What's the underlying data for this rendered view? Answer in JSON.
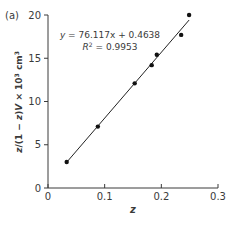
{
  "panel_label": "(a)",
  "chart_data": {
    "type": "scatter",
    "title": "",
    "xlabel": "z",
    "ylabel": "z/(1 − z)V × 10³ cm³",
    "xlim": [
      0,
      0.3
    ],
    "ylim": [
      0,
      20
    ],
    "xticks": [
      0,
      0.1,
      0.2,
      0.3
    ],
    "xtick_labels": [
      "0",
      "0.1",
      "0.2",
      "0.3"
    ],
    "yticks": [
      0,
      5,
      10,
      15,
      20
    ],
    "ytick_labels": [
      "0",
      "5",
      "10",
      "15",
      "20"
    ],
    "grid": false,
    "legend": null,
    "series": [
      {
        "name": "data",
        "x": [
          0.033,
          0.088,
          0.153,
          0.183,
          0.192,
          0.235,
          0.249
        ],
        "y": [
          3.0,
          7.1,
          12.1,
          14.2,
          15.4,
          17.7,
          20.0
        ]
      }
    ],
    "fit_line": {
      "slope": 76.117,
      "intercept": 0.4638,
      "x_range": [
        0.033,
        0.249
      ]
    },
    "annotations": {
      "equation": "y = 76.117x + 0.4638",
      "r_squared_label": "R",
      "r_squared_sup": "2",
      "r_squared_value": " = 0.9953"
    }
  },
  "colors": {
    "axis": "#3a3a3a",
    "marker": "#111111",
    "line": "#222222",
    "text": "#3a3a3a"
  }
}
